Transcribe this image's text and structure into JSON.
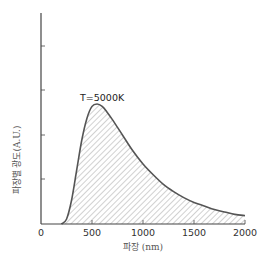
{
  "chart_data": {
    "type": "area",
    "title": "",
    "xlabel": "파장 (nm)",
    "ylabel": "파장별 광도(A.U.)",
    "xlim": [
      0,
      2000
    ],
    "xticks": [
      0,
      500,
      1000,
      1500,
      2000
    ],
    "yticks_count": 4,
    "ytick_labels": [],
    "grid": false,
    "legend": null,
    "annotation": "T=5000K",
    "series": [
      {
        "name": "T=5000K",
        "fill": "hatched",
        "x": [
          200,
          250,
          300,
          350,
          400,
          450,
          500,
          550,
          600,
          650,
          700,
          800,
          900,
          1000,
          1100,
          1200,
          1300,
          1400,
          1500,
          1600,
          1700,
          1800,
          1900,
          2000
        ],
        "values": [
          0.0,
          0.04,
          0.2,
          0.45,
          0.7,
          0.88,
          0.98,
          1.0,
          0.98,
          0.93,
          0.87,
          0.74,
          0.61,
          0.5,
          0.41,
          0.33,
          0.27,
          0.22,
          0.18,
          0.15,
          0.12,
          0.1,
          0.08,
          0.07
        ]
      }
    ],
    "peak": {
      "x": 560,
      "y": 1.0
    }
  },
  "colors": {
    "curve": "#555555",
    "hatch": "#999999",
    "axis": "#444444"
  }
}
